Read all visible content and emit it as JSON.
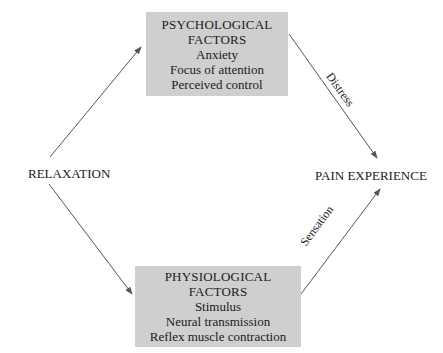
{
  "diagram": {
    "nodes": {
      "relaxation": {
        "label": "RELAXATION"
      },
      "pain_experience": {
        "label": "PAIN EXPERIENCE"
      },
      "psychological": {
        "title_line1": "PSYCHOLOGICAL",
        "title_line2": "FACTORS",
        "items": [
          "Anxiety",
          "Focus of attention",
          "Perceived control"
        ]
      },
      "physiological": {
        "title_line1": "PHYSIOLOGICAL",
        "title_line2": "FACTORS",
        "items": [
          "Stimulus",
          "Neural transmission",
          "Reflex muscle contraction"
        ]
      }
    },
    "edges": [
      {
        "from": "RELAXATION",
        "to": "PSYCHOLOGICAL FACTORS",
        "label": ""
      },
      {
        "from": "RELAXATION",
        "to": "PHYSIOLOGICAL FACTORS",
        "label": ""
      },
      {
        "from": "PSYCHOLOGICAL FACTORS",
        "to": "PAIN EXPERIENCE",
        "label": "Distress"
      },
      {
        "from": "PHYSIOLOGICAL FACTORS",
        "to": "PAIN EXPERIENCE",
        "label": "Sensation"
      }
    ],
    "colors": {
      "box_fill": "#cfcfcf",
      "line": "#555555",
      "text": "#1a1a1a"
    }
  }
}
